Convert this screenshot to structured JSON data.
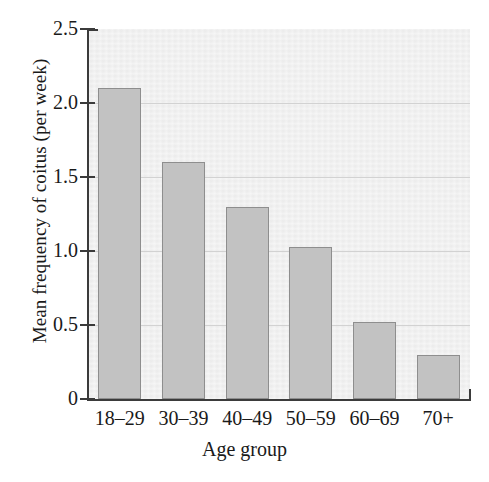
{
  "chart_data": {
    "type": "bar",
    "title": "",
    "xlabel": "Age group",
    "ylabel": "Mean frequency of coitus (per week)",
    "categories": [
      "18–29",
      "30–39",
      "40–49",
      "50–59",
      "60–69",
      "70+"
    ],
    "values": [
      2.1,
      1.6,
      1.3,
      1.03,
      0.52,
      0.3
    ],
    "ylim": [
      0,
      2.5
    ],
    "ytick_labels": [
      "0",
      "0.5",
      "1.0",
      "1.5",
      "2.0",
      "2.5"
    ],
    "ytick_values": [
      0,
      0.5,
      1.0,
      1.5,
      2.0,
      2.5
    ],
    "grid": "horizontal",
    "legend": "none",
    "colors": {
      "bar_fill": "#c2c2c2",
      "bar_edge": "#8e8e8e",
      "plot_background": "#efefef",
      "gridline": "#d2d2d2",
      "axis": "#3b3b3b",
      "text": "#1a1a1a"
    }
  }
}
